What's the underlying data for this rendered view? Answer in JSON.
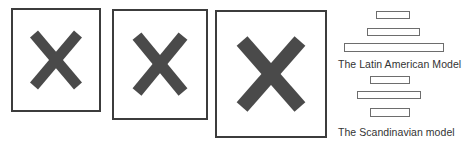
{
  "figure": {
    "width": 467,
    "height": 147,
    "background": "#ffffff",
    "stroke_color": "#3c3c3c",
    "x_mark_color": "#4a4a4a",
    "bar_outline_color": "#6d6d6d",
    "bar_fill_color": "#ffffff",
    "caption_color": "#333333"
  },
  "crossed_boxes": [
    {
      "name": "crossed-box-small",
      "x": 11,
      "y": 8,
      "width": 90,
      "height": 104,
      "mark": "x-cross",
      "label": ""
    },
    {
      "name": "crossed-box-medium",
      "x": 112,
      "y": 9,
      "width": 96,
      "height": 111,
      "mark": "x-cross",
      "label": ""
    },
    {
      "name": "crossed-box-large",
      "x": 215,
      "y": 10,
      "width": 112,
      "height": 128,
      "mark": "x-cross",
      "label": ""
    }
  ],
  "diagrams": [
    {
      "name": "latin-american-model",
      "caption": "The Latin American Model",
      "caption_x": 338,
      "caption_y": 58,
      "shape": "pyramid",
      "bars": [
        {
          "name": "bar-top",
          "x": 376,
          "y": 11,
          "width": 34,
          "height": 8
        },
        {
          "name": "bar-middle",
          "x": 367,
          "y": 28,
          "width": 53,
          "height": 8
        },
        {
          "name": "bar-bottom",
          "x": 344,
          "y": 43,
          "width": 100,
          "height": 9
        }
      ]
    },
    {
      "name": "scandinavian-model",
      "caption": "The Scandinavian model",
      "caption_x": 338,
      "caption_y": 126,
      "shape": "diamond",
      "bars": [
        {
          "name": "bar-top",
          "x": 370,
          "y": 76,
          "width": 40,
          "height": 8
        },
        {
          "name": "bar-middle",
          "x": 357,
          "y": 91,
          "width": 64,
          "height": 8
        },
        {
          "name": "bar-bottom",
          "x": 370,
          "y": 108,
          "width": 40,
          "height": 9
        }
      ]
    }
  ]
}
